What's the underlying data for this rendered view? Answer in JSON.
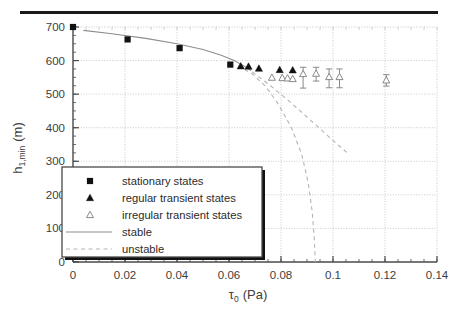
{
  "figure": {
    "separator_rule": "top-horizontal-rule"
  },
  "chart_data": {
    "type": "scatter",
    "title": "",
    "xlabel": "τ₀ (Pa)",
    "xlabel_base": "τ",
    "xlabel_sub": "0",
    "xlabel_unit": "(Pa)",
    "ylabel": "h₁,ₘᵢₙ (m)",
    "ylabel_base": "h",
    "ylabel_sub": "1,min",
    "ylabel_unit": "(m)",
    "xlim": [
      0,
      0.14
    ],
    "ylim": [
      0,
      700
    ],
    "xticks": [
      0,
      0.02,
      0.04,
      0.06,
      0.08,
      0.1,
      0.12,
      0.14
    ],
    "xtick_labels": [
      "0",
      "0.02",
      "0.04",
      "0.06",
      "0.08",
      "0.1",
      "0.12",
      "0.14"
    ],
    "yticks": [
      0,
      100,
      200,
      300,
      400,
      500,
      600,
      700
    ],
    "ytick_labels": [
      "0",
      "100",
      "200",
      "300",
      "400",
      "500",
      "600",
      "700"
    ],
    "x_minor_step": 0.005,
    "y_minor_step": 25,
    "grid": true,
    "grid_style": "dotted-major",
    "legend_position": "lower-left-inside",
    "series": [
      {
        "name": "stationary states",
        "marker": "filled-square",
        "points": [
          {
            "x": 0.0,
            "y": 700
          },
          {
            "x": 0.021,
            "y": 663
          },
          {
            "x": 0.041,
            "y": 637
          },
          {
            "x": 0.0605,
            "y": 588
          }
        ]
      },
      {
        "name": "regular transient states",
        "marker": "filled-triangle",
        "points": [
          {
            "x": 0.0645,
            "y": 583
          },
          {
            "x": 0.0675,
            "y": 582
          },
          {
            "x": 0.0715,
            "y": 576
          },
          {
            "x": 0.0795,
            "y": 572
          },
          {
            "x": 0.0845,
            "y": 571
          }
        ]
      },
      {
        "name": "irregular transient states",
        "marker": "open-triangle",
        "points": [
          {
            "x": 0.0765,
            "y": 549,
            "yerr_low": 0,
            "yerr_high": 0
          },
          {
            "x": 0.0805,
            "y": 548,
            "yerr_low": 0,
            "yerr_high": 0
          },
          {
            "x": 0.0825,
            "y": 547,
            "yerr_low": 0,
            "yerr_high": 0
          },
          {
            "x": 0.0845,
            "y": 545,
            "yerr_low": 0,
            "yerr_high": 0
          },
          {
            "x": 0.0885,
            "y": 560,
            "yerr_low": 42,
            "yerr_high": 20
          },
          {
            "x": 0.0935,
            "y": 561,
            "yerr_low": 22,
            "yerr_high": 19
          },
          {
            "x": 0.0985,
            "y": 551,
            "yerr_low": 32,
            "yerr_high": 24
          },
          {
            "x": 0.1025,
            "y": 551,
            "yerr_low": 32,
            "yerr_high": 24
          },
          {
            "x": 0.1205,
            "y": 541,
            "yerr_low": 17,
            "yerr_high": 17
          }
        ]
      },
      {
        "name": "stable",
        "line": "solid",
        "points": [
          {
            "x": 0.004,
            "y": 690
          },
          {
            "x": 0.015,
            "y": 680
          },
          {
            "x": 0.028,
            "y": 666
          },
          {
            "x": 0.04,
            "y": 650
          },
          {
            "x": 0.05,
            "y": 633
          },
          {
            "x": 0.057,
            "y": 616
          },
          {
            "x": 0.062,
            "y": 600
          },
          {
            "x": 0.0655,
            "y": 585
          },
          {
            "x": 0.0685,
            "y": 570
          }
        ]
      },
      {
        "name": "unstable-branch-1",
        "line": "dashed",
        "points": [
          {
            "x": 0.0635,
            "y": 585
          },
          {
            "x": 0.069,
            "y": 560
          },
          {
            "x": 0.074,
            "y": 524
          },
          {
            "x": 0.079,
            "y": 470
          },
          {
            "x": 0.084,
            "y": 400
          },
          {
            "x": 0.088,
            "y": 320
          },
          {
            "x": 0.0905,
            "y": 235
          },
          {
            "x": 0.092,
            "y": 150
          },
          {
            "x": 0.0928,
            "y": 70
          },
          {
            "x": 0.0932,
            "y": 0
          }
        ]
      },
      {
        "name": "unstable-branch-2",
        "line": "dashed",
        "points": [
          {
            "x": 0.069,
            "y": 566
          },
          {
            "x": 0.076,
            "y": 525
          },
          {
            "x": 0.083,
            "y": 480
          },
          {
            "x": 0.09,
            "y": 432
          },
          {
            "x": 0.096,
            "y": 390
          },
          {
            "x": 0.101,
            "y": 355
          },
          {
            "x": 0.1055,
            "y": 325
          }
        ]
      }
    ],
    "legend_entries": [
      {
        "label": "stationary states",
        "marker": "filled-square"
      },
      {
        "label": "regular transient states",
        "marker": "filled-triangle"
      },
      {
        "label": "irregular transient states",
        "marker": "open-triangle"
      },
      {
        "label": "stable",
        "marker": "solid-line"
      },
      {
        "label": "unstable",
        "marker": "dashed-line"
      }
    ]
  },
  "colors": {
    "axis": "#4a4a4a",
    "grid": "#bdbdbd",
    "marker_fill": "#111111",
    "open_marker_stroke": "#7d7d7d",
    "stable_line": "#8d8d8d",
    "unstable_line": "#b4b4b4",
    "rule": "#1a1a1a",
    "legend_border": "#4a4a4a",
    "legend_shadow": "#111111"
  }
}
